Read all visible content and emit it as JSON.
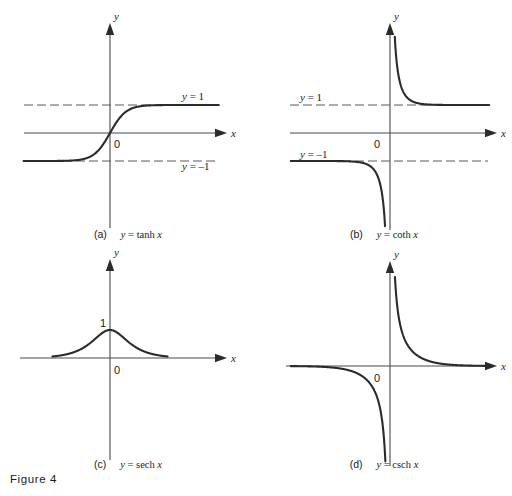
{
  "figure": {
    "number_label": "Figure 4",
    "background": "#ffffff",
    "curve_color": "#2b2b2b",
    "axis_color": "#4a4a4a",
    "asymptote_color": "#5a5a5a"
  },
  "labels": {
    "x_axis": "x",
    "y_axis": "y",
    "origin": "0",
    "one": "1",
    "y_equals_one": "y = 1",
    "y_equals_minus_one": "y = –1"
  },
  "panels": [
    {
      "id": "a",
      "tag": "(a)",
      "equation": "y = tanh x",
      "function": "tanh",
      "origin": {
        "x": 110,
        "y": 133
      },
      "x_axis": {
        "x1": 24,
        "x2": 218,
        "arrow_x": 218
      },
      "y_axis": {
        "y1": 32,
        "y2": 228,
        "arrow_y": 32
      },
      "scale": {
        "x": 16,
        "y": 28
      },
      "domain": {
        "min": -5.4,
        "max": 6.8
      },
      "asymptotes": [
        {
          "value": 1,
          "label": "y = 1",
          "label_x": 182,
          "label_y": 100,
          "x1": 24,
          "x2": 218
        },
        {
          "value": -1,
          "label": "y = –1",
          "label_x": 182,
          "label_y": 170,
          "x1": 24,
          "x2": 218
        }
      ],
      "origin_label_pos": {
        "x": 114,
        "y": 148
      },
      "tick_labels": []
    },
    {
      "id": "b",
      "tag": "(b)",
      "equation": "y = coth x",
      "function": "coth",
      "origin": {
        "x": 134,
        "y": 133
      },
      "x_axis": {
        "x1": 34,
        "x2": 232,
        "arrow_x": 232
      },
      "y_axis": {
        "y1": 32,
        "y2": 230,
        "arrow_y": 32
      },
      "scale": {
        "x": 16,
        "y": 28
      },
      "domain": {
        "min": -6.2,
        "max": 6.2
      },
      "clip": {
        "top": 36,
        "bottom": 228
      },
      "asymptotes": [
        {
          "value": 1,
          "label": "y = 1",
          "label_x": 44,
          "label_y": 101,
          "x1": 34,
          "x2": 232
        },
        {
          "value": -1,
          "label": "y = –1",
          "label_x": 44,
          "label_y": 158,
          "x1": 34,
          "x2": 232
        }
      ],
      "origin_label_pos": {
        "x": 118,
        "y": 148
      },
      "tick_labels": []
    },
    {
      "id": "c",
      "tag": "(c)",
      "equation": "y = sech x",
      "function": "sech",
      "origin": {
        "x": 110,
        "y": 110
      },
      "x_axis": {
        "x1": 20,
        "x2": 218,
        "arrow_x": 218
      },
      "y_axis": {
        "y1": 20,
        "y2": 212,
        "arrow_y": 20
      },
      "scale": {
        "x": 16,
        "y": 28
      },
      "domain": {
        "min": -3.6,
        "max": 3.6
      },
      "asymptotes": [],
      "origin_label_pos": {
        "x": 114,
        "y": 126
      },
      "tick_labels": [
        {
          "text": "1",
          "x": 100,
          "y": 79
        }
      ]
    },
    {
      "id": "d",
      "tag": "(d)",
      "equation": "y = csch x",
      "function": "csch",
      "origin": {
        "x": 134,
        "y": 118
      },
      "x_axis": {
        "x1": 30,
        "x2": 232,
        "arrow_x": 232
      },
      "y_axis": {
        "y1": 22,
        "y2": 218,
        "arrow_y": 22
      },
      "scale": {
        "x": 16,
        "y": 28
      },
      "domain": {
        "min": -6.2,
        "max": 6.2
      },
      "clip": {
        "top": 26,
        "bottom": 216
      },
      "asymptotes": [],
      "origin_label_pos": {
        "x": 118,
        "y": 134
      },
      "tick_labels": []
    }
  ],
  "chart_data": {
    "type": "line",
    "title": "Figure 4",
    "xlabel": "x",
    "ylabel": "y",
    "grid": false,
    "legend": "none",
    "subplots": [
      {
        "panel": "(a)",
        "title": "y = tanh x",
        "function": "tanh",
        "xlim": [
          -5.4,
          6.8
        ],
        "ylim": [
          -3.6,
          3.4
        ],
        "asymptotes": [
          1,
          -1
        ],
        "asymptote_labels": [
          "y = 1",
          "y = –1"
        ],
        "points": [
          {
            "x": -4,
            "y": -0.9993
          },
          {
            "x": -3,
            "y": -0.9951
          },
          {
            "x": -2,
            "y": -0.964
          },
          {
            "x": -1.5,
            "y": -0.9051
          },
          {
            "x": -1,
            "y": -0.7616
          },
          {
            "x": -0.5,
            "y": -0.4621
          },
          {
            "x": 0,
            "y": 0
          },
          {
            "x": 0.5,
            "y": 0.4621
          },
          {
            "x": 1,
            "y": 0.7616
          },
          {
            "x": 1.5,
            "y": 0.9051
          },
          {
            "x": 2,
            "y": 0.964
          },
          {
            "x": 3,
            "y": 0.9951
          },
          {
            "x": 4,
            "y": 0.9993
          }
        ]
      },
      {
        "panel": "(b)",
        "title": "y = coth x",
        "function": "coth",
        "xlim": [
          -6.2,
          6.2
        ],
        "ylim": [
          -3.6,
          3.6
        ],
        "asymptotes": [
          1,
          -1,
          "x = 0"
        ],
        "asymptote_labels": [
          "y = 1",
          "y = –1"
        ],
        "points": [
          {
            "x": -4,
            "y": -1.0007
          },
          {
            "x": -3,
            "y": -1.005
          },
          {
            "x": -2,
            "y": -1.0373
          },
          {
            "x": -1.5,
            "y": -1.1048
          },
          {
            "x": -1,
            "y": -1.313
          },
          {
            "x": -0.5,
            "y": -2.164
          },
          {
            "x": -0.3,
            "y": -3.4327
          },
          {
            "x": 0.3,
            "y": 3.4327
          },
          {
            "x": 0.5,
            "y": 2.164
          },
          {
            "x": 1,
            "y": 1.313
          },
          {
            "x": 1.5,
            "y": 1.1048
          },
          {
            "x": 2,
            "y": 1.0373
          },
          {
            "x": 3,
            "y": 1.005
          },
          {
            "x": 4,
            "y": 1.0007
          }
        ]
      },
      {
        "panel": "(c)",
        "title": "y = sech x",
        "function": "sech",
        "xlim": [
          -3.6,
          3.6
        ],
        "ylim": [
          -3.3,
          3.2
        ],
        "asymptotes": [
          0
        ],
        "asymptote_labels": [],
        "peak": {
          "x": 0,
          "y": 1
        },
        "points": [
          {
            "x": -3,
            "y": 0.0993
          },
          {
            "x": -2.5,
            "y": 0.1631
          },
          {
            "x": -2,
            "y": 0.2658
          },
          {
            "x": -1.5,
            "y": 0.4251
          },
          {
            "x": -1,
            "y": 0.6481
          },
          {
            "x": -0.5,
            "y": 0.8868
          },
          {
            "x": 0,
            "y": 1
          },
          {
            "x": 0.5,
            "y": 0.8868
          },
          {
            "x": 1,
            "y": 0.6481
          },
          {
            "x": 1.5,
            "y": 0.4251
          },
          {
            "x": 2,
            "y": 0.2658
          },
          {
            "x": 2.5,
            "y": 0.1631
          },
          {
            "x": 3,
            "y": 0.0993
          }
        ]
      },
      {
        "panel": "(d)",
        "title": "y = csch x",
        "function": "csch",
        "xlim": [
          -6.2,
          6.2
        ],
        "ylim": [
          -3.3,
          3.4
        ],
        "asymptotes": [
          0,
          "x = 0"
        ],
        "asymptote_labels": [],
        "points": [
          {
            "x": -4,
            "y": -0.0366
          },
          {
            "x": -3,
            "y": -0.0998
          },
          {
            "x": -2,
            "y": -0.2757
          },
          {
            "x": -1.5,
            "y": -0.4696
          },
          {
            "x": -1,
            "y": -0.8509
          },
          {
            "x": -0.6,
            "y": -1.5644
          },
          {
            "x": -0.35,
            "y": -2.8051
          },
          {
            "x": 0.35,
            "y": 2.8051
          },
          {
            "x": 0.6,
            "y": 1.5644
          },
          {
            "x": 1,
            "y": 0.8509
          },
          {
            "x": 1.5,
            "y": 0.4696
          },
          {
            "x": 2,
            "y": 0.2757
          },
          {
            "x": 3,
            "y": 0.0998
          },
          {
            "x": 4,
            "y": 0.0366
          }
        ]
      }
    ]
  }
}
